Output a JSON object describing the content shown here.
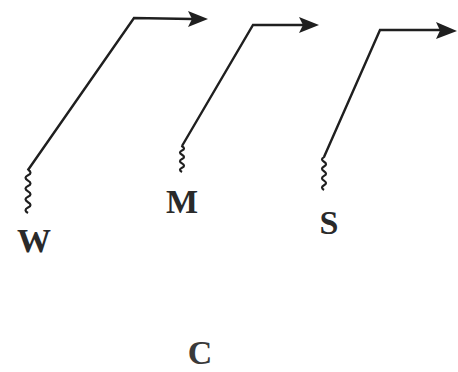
{
  "diagram": {
    "type": "schematic-paths",
    "stroke_color": "#1f1f1f",
    "background": "#ffffff",
    "paths": [
      {
        "id": "W",
        "label": "W",
        "label_pos": [
          34,
          252
        ],
        "wave": {
          "x": 28,
          "y_top": 170,
          "y_bottom": 213
        },
        "diagonal": [
          [
            28,
            170
          ],
          [
            134,
            18
          ]
        ],
        "horizontal": [
          [
            134,
            18
          ],
          [
            190,
            19
          ]
        ],
        "arrow_tip": [
          208,
          19
        ]
      },
      {
        "id": "M",
        "label": "M",
        "label_pos": [
          182,
          213
        ],
        "wave": {
          "x": 182,
          "y_top": 146,
          "y_bottom": 172
        },
        "diagonal": [
          [
            182,
            146
          ],
          [
            253,
            25
          ]
        ],
        "horizontal": [
          [
            253,
            25
          ],
          [
            300,
            25
          ]
        ],
        "arrow_tip": [
          319,
          25
        ]
      },
      {
        "id": "S",
        "label": "S",
        "label_pos": [
          329,
          234
        ],
        "wave": {
          "x": 324,
          "y_top": 157,
          "y_bottom": 190
        },
        "diagonal": [
          [
            324,
            157
          ],
          [
            380,
            30
          ]
        ],
        "horizontal": [
          [
            380,
            30
          ],
          [
            437,
            30
          ]
        ],
        "arrow_tip": [
          457,
          31
        ]
      }
    ],
    "bottom_label": {
      "text": "C",
      "pos": [
        200,
        364
      ]
    }
  }
}
